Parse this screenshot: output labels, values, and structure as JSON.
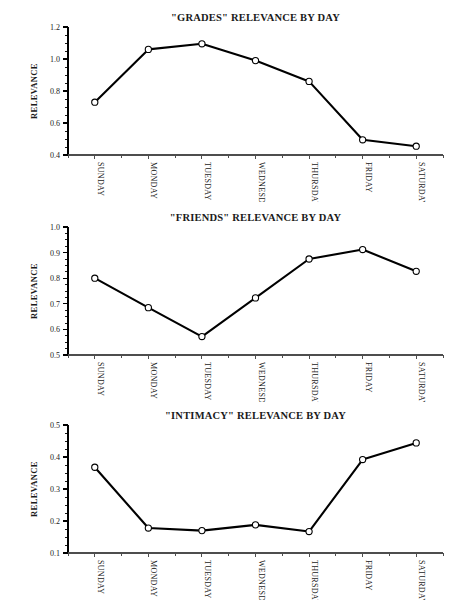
{
  "figure": {
    "background_color": "#ffffff",
    "line_color": "#000000",
    "marker_fill_color": "#ffffff",
    "text_color": "#1a1a1a"
  },
  "chart_data": [
    {
      "type": "line",
      "title": "\"GRADES\" RELEVANCE BY DAY",
      "xlabel": "",
      "ylabel": "RELEVANCE",
      "categories": [
        "SUNDAY",
        "MONDAY",
        "TUESDAY",
        "WEDNESDAY",
        "THURSDAY",
        "FRIDAY",
        "SATURDAY"
      ],
      "values": [
        0.73,
        1.06,
        1.095,
        0.99,
        0.86,
        0.495,
        0.455
      ],
      "ylim": [
        0.4,
        1.2
      ],
      "ytick_labels": [
        "0.4",
        "0.6",
        "0.8",
        "1.0",
        "1.2"
      ],
      "ytick_values": [
        0.4,
        0.6,
        0.8,
        1.0,
        1.2
      ],
      "yminor_step": 0.05,
      "grid": false,
      "legend": "none",
      "marker": "circle-open"
    },
    {
      "type": "line",
      "title": "\"FRIENDS\" RELEVANCE BY DAY",
      "xlabel": "",
      "ylabel": "RELEVANCE",
      "categories": [
        "SUNDAY",
        "MONDAY",
        "TUESDAY",
        "WEDNESDAY",
        "THURSDAY",
        "FRIDAY",
        "SATURDAY"
      ],
      "values": [
        0.8,
        0.685,
        0.572,
        0.723,
        0.875,
        0.912,
        0.827
      ],
      "ylim": [
        0.5,
        1.0
      ],
      "ytick_labels": [
        "0.5",
        "0.6",
        "0.7",
        "0.8",
        "0.9",
        "1.0"
      ],
      "ytick_values": [
        0.5,
        0.6,
        0.7,
        0.8,
        0.9,
        1.0
      ],
      "yminor_step": 0.025,
      "grid": false,
      "legend": "none",
      "marker": "circle-open"
    },
    {
      "type": "line",
      "title": "\"INTIMACY\" RELEVANCE BY DAY",
      "xlabel": "",
      "ylabel": "RELEVANCE",
      "categories": [
        "SUNDAY",
        "MONDAY",
        "TUESDAY",
        "WEDNESDAY",
        "THURSDAY",
        "FRIDAY",
        "SATURDAY"
      ],
      "values": [
        0.368,
        0.178,
        0.17,
        0.188,
        0.167,
        0.392,
        0.444
      ],
      "ylim": [
        0.1,
        0.5
      ],
      "ytick_labels": [
        "0.1",
        "0.2",
        "0.3",
        "0.4",
        "0.5"
      ],
      "ytick_values": [
        0.1,
        0.2,
        0.3,
        0.4,
        0.5
      ],
      "yminor_step": 0.025,
      "grid": false,
      "legend": "none",
      "marker": "circle-open"
    }
  ]
}
